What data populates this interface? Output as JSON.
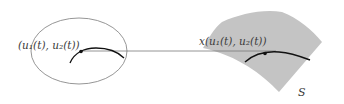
{
  "diagram": {
    "parameter_domain": {
      "shape": "ellipse",
      "point_label": "(u₁(t), u₂(t))",
      "stroke_color": "#888888"
    },
    "surface": {
      "name_label": "S",
      "point_label": "x(u₁(t), u₂(t))",
      "fill_color": "#c4c4c4"
    },
    "mapping_line": {
      "color": "#777777"
    },
    "curve_color": "#111111"
  }
}
